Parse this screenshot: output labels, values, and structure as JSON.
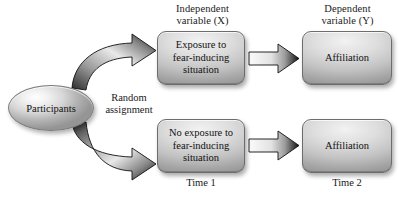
{
  "diagram": {
    "colors": {
      "box_light": "#f2f2f2",
      "box_mid": "#c3c3c3",
      "box_dark": "#8f8f8f",
      "outline": "#6d6d6d",
      "text": "#111111",
      "background": "#ffffff",
      "arrow_dark": "#111111",
      "arrow_light": "#f4f4f4"
    },
    "column_headers": {
      "independent": "Independent\nvariable (X)",
      "dependent": "Dependent\nvariable (Y)"
    },
    "footer_labels": {
      "time1": "Time 1",
      "time2": "Time 2"
    },
    "source_node": {
      "label": "Participants"
    },
    "mid_label": {
      "text": "Random\nassignment"
    },
    "branches": [
      {
        "id": "experimental",
        "condition_box": "Exposure to\nfear-inducing\nsituation",
        "outcome_box": "Affiliation"
      },
      {
        "id": "control",
        "condition_box": "No exposure to\nfear-inducing\nsituation",
        "outcome_box": "Affiliation"
      }
    ]
  }
}
